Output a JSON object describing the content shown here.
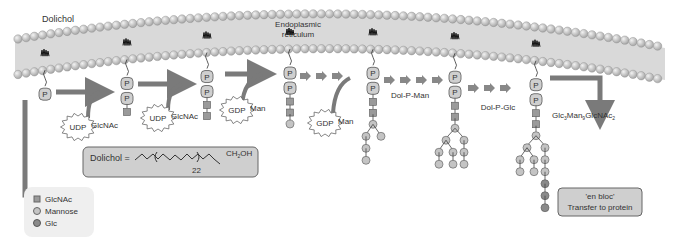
{
  "labels": {
    "dolichol": "Dolichol",
    "er_line1": "Endoplasmic",
    "er_line2": "reticulum",
    "udp1": "UDP",
    "glcnac1": "GlcNAc",
    "udp2": "UDP",
    "glcnac2": "GlcNAc",
    "gdp1": "GDP",
    "man1": "Man",
    "gdp2": "GDP",
    "man2": "Man",
    "dolpman": "Dol-P-Man",
    "dolpglc": "Dol-P-Glc",
    "product": "Glc3Man9GlcNAc2",
    "p": "P"
  },
  "formula_box": {
    "prefix": "Dolichol =",
    "repeat": "22",
    "suffix": "CH2OH"
  },
  "transfer_box": {
    "line1": "'en bloc'",
    "line2": "Transfer to protein"
  },
  "legend": {
    "items": [
      {
        "shape": "square",
        "label": "GlcNAc",
        "color": "#9a9a9a"
      },
      {
        "shape": "circle",
        "label": "Mannose",
        "color": "#c4c4c4"
      },
      {
        "shape": "circle",
        "label": "Glc",
        "color": "#8a8a8a"
      }
    ]
  },
  "colors": {
    "membrane": "#d8d8d8",
    "bead": "#c8c8c8",
    "arrow": "#7a7a7a",
    "box": "#cfcfcf"
  }
}
